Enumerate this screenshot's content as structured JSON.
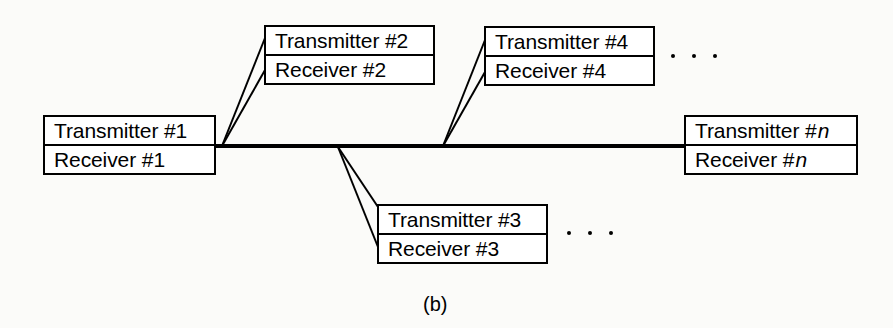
{
  "figure": {
    "caption": "(b)",
    "colors": {
      "stroke": "#000000",
      "background": "#fbfbf9",
      "box_fill": "#ffffff"
    }
  },
  "nodes": [
    {
      "id": "node-1",
      "transmitter": "Transmitter #1",
      "receiver": "Receiver #1",
      "index": "1",
      "italic_index": false
    },
    {
      "id": "node-2",
      "transmitter": "Transmitter #2",
      "receiver": "Receiver #2",
      "index": "2",
      "italic_index": false
    },
    {
      "id": "node-3",
      "transmitter": "Transmitter #3",
      "receiver": "Receiver #3",
      "index": "3",
      "italic_index": false
    },
    {
      "id": "node-4",
      "transmitter": "Transmitter #4",
      "receiver": "Receiver #4",
      "index": "4",
      "italic_index": false
    },
    {
      "id": "node-n",
      "transmitter_prefix": "Transmitter #",
      "receiver_prefix": "Receiver #",
      "index": "n",
      "italic_index": true
    }
  ],
  "ellipses": [
    {
      "id": "ellipsis-top",
      "dots": 3
    },
    {
      "id": "ellipsis-bottom",
      "dots": 3
    }
  ]
}
